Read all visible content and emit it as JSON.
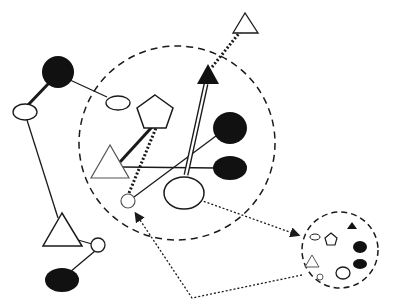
{
  "diagram": {
    "title": "",
    "colors": {
      "stroke": "#1a1a1a",
      "fill_dark": "#111111",
      "fill_light": "#ffffff"
    },
    "left_group": {
      "nodes": [
        {
          "id": "L1",
          "shape": "circle",
          "fill": "black"
        },
        {
          "id": "L2",
          "shape": "ellipse",
          "fill": "white"
        },
        {
          "id": "L3",
          "shape": "ellipse",
          "fill": "white"
        },
        {
          "id": "L4",
          "shape": "triangle",
          "fill": "white"
        },
        {
          "id": "L5",
          "shape": "circle",
          "fill": "white"
        },
        {
          "id": "L6",
          "shape": "ellipse",
          "fill": "black"
        }
      ],
      "edges": [
        {
          "from": "L1",
          "to": "L2",
          "style": "thick"
        },
        {
          "from": "L1",
          "to": "L3",
          "style": "thin"
        },
        {
          "from": "L2",
          "to": "L4",
          "style": "thin"
        },
        {
          "from": "L4",
          "to": "L5",
          "style": "thin"
        },
        {
          "from": "L5",
          "to": "L6",
          "style": "thin"
        }
      ]
    },
    "main_cluster": {
      "boundary": "dashed-circle",
      "nodes": [
        {
          "id": "M1",
          "shape": "pentagon",
          "fill": "white"
        },
        {
          "id": "M2",
          "shape": "triangle",
          "fill": "white"
        },
        {
          "id": "M3",
          "shape": "circle",
          "fill": "white"
        },
        {
          "id": "M4",
          "shape": "ellipse",
          "fill": "white"
        },
        {
          "id": "M5",
          "shape": "ellipse",
          "fill": "black"
        },
        {
          "id": "M6",
          "shape": "ellipse",
          "fill": "black"
        },
        {
          "id": "M7",
          "shape": "triangle",
          "fill": "black"
        }
      ],
      "edges": [
        {
          "from": "M2",
          "to": "M1",
          "style": "thick"
        },
        {
          "from": "M3",
          "to": "M1",
          "style": "dotted-thick"
        },
        {
          "from": "M2",
          "to": "M6",
          "style": "thin"
        },
        {
          "from": "M3",
          "to": "M5",
          "style": "thin"
        },
        {
          "from": "M4",
          "to": "M7",
          "style": "triple"
        }
      ]
    },
    "external": [
      {
        "id": "E1",
        "shape": "triangle",
        "fill": "white",
        "link_to": "M7",
        "style": "dotted-thick"
      }
    ],
    "inset_cluster": {
      "boundary": "dashed-circle",
      "nodes": [
        "ellipse-white",
        "pentagon-white",
        "triangle-black",
        "ellipse-black",
        "ellipse-black",
        "triangle-white",
        "circle-white",
        "ellipse-white"
      ]
    },
    "arrows": [
      {
        "from": "M4",
        "to": "inset_cluster",
        "style": "dotted-arrow"
      },
      {
        "from": "inset_cluster",
        "to": "M3",
        "style": "dotted-arrow",
        "via": "bottom"
      }
    ],
    "caption": ""
  }
}
